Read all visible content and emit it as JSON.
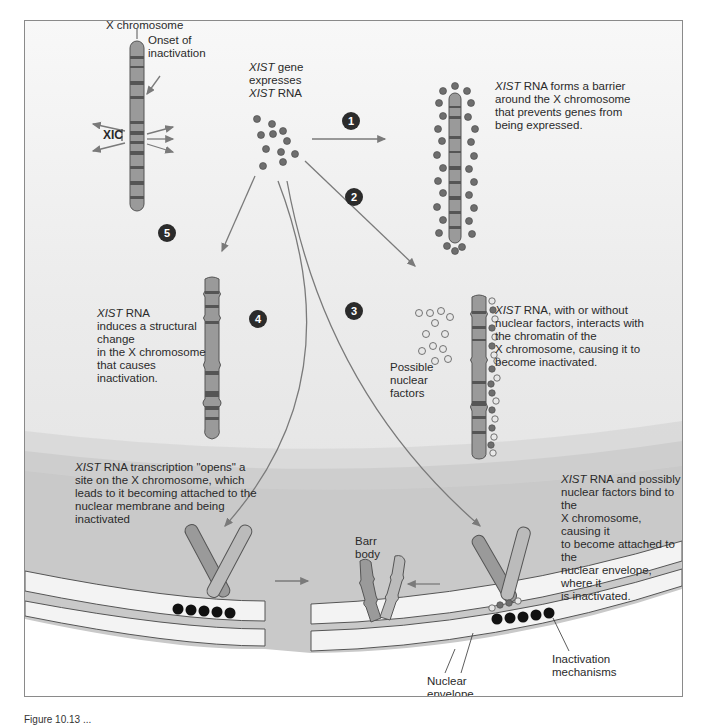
{
  "figure": {
    "labels": {
      "x_chromosome": "X chromosome",
      "onset": "Onset of inactivation",
      "onset_line1": "Onset of",
      "onset_line2": "inactivation",
      "xic": "XIC",
      "xist_expr_1_italic": "XIST",
      "xist_expr_1_rest": " gene",
      "xist_expr_2": "expresses",
      "xist_expr_3_italic": "XIST",
      "xist_expr_3_rest": " RNA",
      "possible_1": "Possible",
      "possible_2": "nuclear",
      "possible_3": "factors",
      "barr_1": "Barr",
      "barr_2": "body",
      "nuclear_env_1": "Nuclear",
      "nuclear_env_2": "envelope",
      "inact_mech_1": "Inactivation",
      "inact_mech_2": "mechanisms"
    },
    "steps": [
      {
        "number": "1",
        "italic": "XIST",
        "lines": [
          " RNA forms a barrier",
          "around the X chromosome",
          "that prevents genes from",
          "being expressed."
        ]
      },
      {
        "number": "2",
        "italic": "XIST",
        "lines": [
          " RNA, with or without",
          "nuclear factors, interacts with",
          "the chromatin of the",
          "X chromosome, causing it to",
          "become inactivated."
        ]
      },
      {
        "number": "3",
        "italic": "XIST",
        "lines": [
          " RNA and possibly",
          "nuclear factors bind to the",
          "X chromosome, causing it",
          "to become attached to the",
          "nuclear envelope, where it",
          "is inactivated."
        ]
      },
      {
        "number": "4",
        "italic": "XIST",
        "lines": [
          " RNA transcription \"opens\" a",
          "site on the X chromosome, which",
          "leads to it becoming attached to the",
          "nuclear membrane and being",
          "inactivated"
        ]
      },
      {
        "number": "5",
        "italic": "XIST",
        "lines": [
          " RNA",
          "induces a structural",
          "change",
          "in the X chromosome",
          "that causes",
          "inactivation."
        ]
      }
    ],
    "colors": {
      "background_top": "#f8f8f8",
      "background_bottom": "#dedede",
      "nucleus": "#c8c8c8",
      "arrow": "#7a7a7a",
      "rna_dot": "#6e6e6e",
      "factor_dot": "#e8e8e8",
      "mechanism_dot": "#111111",
      "step_badge": "#2b2b2b"
    }
  },
  "caption": "Figure 10.13 ..."
}
